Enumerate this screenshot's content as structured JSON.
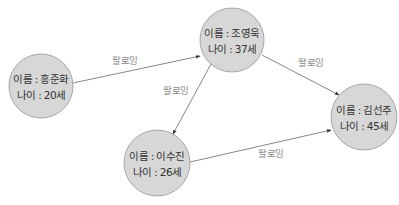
{
  "diagram": {
    "type": "social-follow-graph",
    "style": {
      "node_fill": "#d7d7d7",
      "node_stroke": "#a6a6a6",
      "edge_color": "#7a7a7a",
      "label_color": "#8a8a8a",
      "text_color": "#333333"
    },
    "nodes": [
      {
        "id": "hong",
        "name_line": "이름 : 홍준화",
        "age_line": "나이 : 20세",
        "cx": 41,
        "cy": 86,
        "r": 32
      },
      {
        "id": "jo",
        "name_line": "이름 : 조영욱",
        "age_line": "나이 : 37세",
        "cx": 232,
        "cy": 40,
        "r": 32
      },
      {
        "id": "kim",
        "name_line": "이름 : 김선주",
        "age_line": "나이 : 45세",
        "cx": 364,
        "cy": 117,
        "r": 33
      },
      {
        "id": "lee",
        "name_line": "이름 : 이수진",
        "age_line": "나이 : 26세",
        "cx": 157,
        "cy": 163,
        "r": 33
      }
    ],
    "edges": [
      {
        "from": "hong",
        "to": "jo",
        "label": "팔로잉",
        "x1": 73,
        "y1": 83,
        "x2": 200,
        "y2": 56,
        "lx": 125,
        "ly": 64
      },
      {
        "from": "jo",
        "to": "kim",
        "label": "팔로잉",
        "x1": 262,
        "y1": 55,
        "x2": 339,
        "y2": 95,
        "lx": 311,
        "ly": 66
      },
      {
        "from": "jo",
        "to": "lee",
        "label": "팔로잉",
        "x1": 211,
        "y1": 64,
        "x2": 173,
        "y2": 134,
        "lx": 176,
        "ly": 94
      },
      {
        "from": "lee",
        "to": "kim",
        "label": "팔로잉",
        "x1": 190,
        "y1": 162,
        "x2": 331,
        "y2": 130,
        "lx": 271,
        "ly": 157
      }
    ]
  }
}
